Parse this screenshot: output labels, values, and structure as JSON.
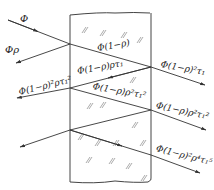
{
  "diagram": {
    "colors": {
      "line": "#333333",
      "plate_edge": "#444444",
      "hatch": "#888888",
      "background": "#ffffff"
    },
    "labels": {
      "incident": "Φ",
      "reflected_first": "Φρ",
      "inside_first": "Φ(1−ρ)",
      "transmitted_first": "Φ(1−ρ)²τ₁",
      "inside_reflected": "Φ(1−ρ)ρτ₁",
      "reflected_second": "Φ(1−ρ)²ρτ₁²",
      "inside_second": "Φ(1−ρ)ρ²τ₁²",
      "transmitted_second": "Φ(1−ρ)ρ²τ₁²",
      "transmitted_third": "Φ(1−ρ)²ρ⁴τ₁⁵"
    }
  }
}
